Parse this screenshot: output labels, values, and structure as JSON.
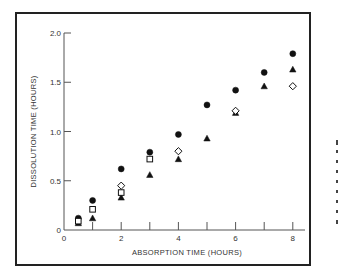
{
  "chart_data": {
    "type": "scatter",
    "title": "",
    "xlabel": "ABSORPTION TIME (HOURS)",
    "ylabel": "DISSOLUTION TIME (HOURS)",
    "xlim": [
      0,
      8.4
    ],
    "ylim": [
      0,
      2.0
    ],
    "x_ticks": [
      0,
      1,
      2,
      3,
      4,
      5,
      6,
      7,
      8
    ],
    "x_tick_labels": [
      "0",
      "2",
      "4",
      "6",
      "8"
    ],
    "y_ticks": [
      0,
      0.5,
      1.0,
      1.5,
      2.0
    ],
    "y_tick_labels": [
      "0",
      "0.5",
      "1.0",
      "1.5",
      "2.0"
    ],
    "grid": false,
    "legend": null,
    "series": [
      {
        "name": "filled-circle",
        "marker": "circle",
        "filled": true,
        "x": [
          0.5,
          1,
          2,
          3,
          4,
          5,
          6,
          7,
          8
        ],
        "y": [
          0.12,
          0.3,
          0.62,
          0.79,
          0.97,
          1.27,
          1.42,
          1.6,
          1.79
        ]
      },
      {
        "name": "filled-triangle",
        "marker": "triangle",
        "filled": true,
        "x": [
          0.5,
          1,
          2,
          3,
          4,
          5,
          6,
          7,
          8
        ],
        "y": [
          0.07,
          0.12,
          0.33,
          0.56,
          0.72,
          0.93,
          1.19,
          1.46,
          1.63
        ]
      },
      {
        "name": "open-diamond",
        "marker": "diamond",
        "filled": false,
        "x": [
          2,
          4,
          6,
          8
        ],
        "y": [
          0.45,
          0.8,
          1.21,
          1.46
        ]
      },
      {
        "name": "open-square",
        "marker": "square",
        "filled": false,
        "x": [
          0.5,
          1,
          2,
          3
        ],
        "y": [
          0.09,
          0.21,
          0.38,
          0.72
        ]
      }
    ]
  },
  "plot": {
    "origin_px": [
      64,
      230
    ],
    "x_px_per_unit": 28.6,
    "y_px_per_unit": 98.5,
    "x_axis_end_px": 305
  }
}
